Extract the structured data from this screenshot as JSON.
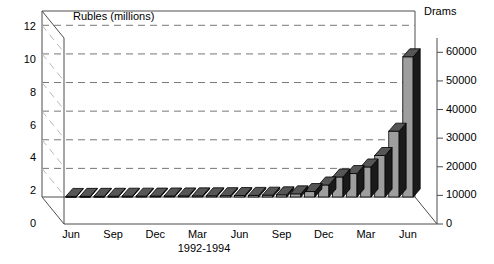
{
  "chart_data": {
    "type": "bar",
    "title": "",
    "subtitle": "",
    "style": "3d-bar",
    "left_axis": {
      "label": "Rubles (millions)",
      "ticks": [
        0,
        2,
        4,
        6,
        8,
        10,
        12
      ],
      "tick_labels": [
        "0",
        "2",
        "4",
        "6",
        "8",
        "10",
        "12"
      ],
      "min": 0,
      "max": 13,
      "grid": true,
      "gridline_style": "dashed"
    },
    "right_axis": {
      "label": "Drams",
      "ticks": [
        0,
        10000,
        20000,
        30000,
        40000,
        50000,
        60000
      ],
      "tick_labels": [
        "0",
        "10000",
        "20000",
        "30000",
        "40000",
        "50000",
        "60000"
      ],
      "min": 0,
      "max": 65000
    },
    "xlabel": "1992-1994",
    "xtick_labels": [
      "Jun",
      "Sep",
      "Dec",
      "Mar",
      "Jun",
      "Sep",
      "Dec",
      "Mar",
      "Jun"
    ],
    "xtick_indices": [
      0,
      3,
      6,
      9,
      12,
      15,
      18,
      21,
      24
    ],
    "categories": [
      "Jun 1992",
      "Jul 1992",
      "Aug 1992",
      "Sep 1992",
      "Oct 1992",
      "Nov 1992",
      "Dec 1992",
      "Jan 1993",
      "Feb 1993",
      "Mar 1993",
      "Apr 1993",
      "May 1993",
      "Jun 1993",
      "Jul 1993",
      "Aug 1993",
      "Sep 1993",
      "Oct 1993",
      "Nov 1993",
      "Dec 1993",
      "Jan 1994",
      "Feb 1994",
      "Mar 1994",
      "Apr 1994",
      "May 1994",
      "Jun 1994"
    ],
    "values": [
      200,
      220,
      240,
      260,
      280,
      300,
      320,
      350,
      380,
      400,
      430,
      460,
      500,
      560,
      640,
      760,
      1100,
      1900,
      4200,
      7000,
      8200,
      10500,
      14500,
      23000,
      49000
    ],
    "value_unit": "Drams",
    "legend": [],
    "legend_position": "none",
    "trailing_values": [
      49000,
      33000,
      27000
    ]
  },
  "colors": {
    "bar_front": "#9e9e9e",
    "bar_side": "#1a1a1a",
    "bar_top": "#565656",
    "axis": "#4d4d4d",
    "grid": "#777777",
    "text": "#000000",
    "background": "#ffffff",
    "floor": "#ffffff"
  }
}
